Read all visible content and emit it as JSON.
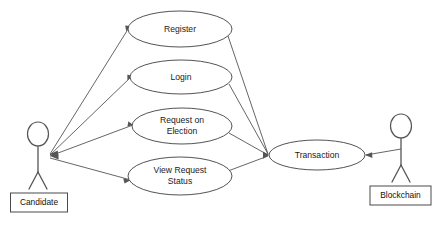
{
  "diagram": {
    "type": "uml-use-case",
    "background_color": "#ffffff",
    "line_color": "#555555",
    "shape_stroke_color": "#3f3f3f",
    "text_color": "#1a1a1a"
  },
  "actors": [
    {
      "id": "candidate",
      "label": "Candidate",
      "side": "left",
      "head_center": [
        38,
        134
      ],
      "body_point": [
        48,
        155
      ]
    },
    {
      "id": "blockchain",
      "label": "Blockchain",
      "side": "right",
      "head_center": [
        401,
        126
      ],
      "body_point": [
        401,
        150
      ]
    }
  ],
  "use_cases": [
    {
      "id": "register",
      "label": "Register",
      "lines": [
        "Register"
      ],
      "cx": 180,
      "cy": 29,
      "rx": 52,
      "ry": 18
    },
    {
      "id": "login",
      "label": "Login",
      "lines": [
        "Login"
      ],
      "cx": 181,
      "cy": 77,
      "rx": 51,
      "ry": 17
    },
    {
      "id": "request-on-election",
      "label": "Request on Election",
      "lines": [
        "Request on",
        "Election"
      ],
      "cx": 182,
      "cy": 126,
      "rx": 50,
      "ry": 18
    },
    {
      "id": "view-request-status",
      "label": "View Request Status",
      "lines": [
        "View Request",
        "Status"
      ],
      "cx": 180,
      "cy": 176,
      "rx": 52,
      "ry": 19
    },
    {
      "id": "transaction",
      "label": "Transaction",
      "lines": [
        "Transaction"
      ],
      "cx": 317,
      "cy": 155,
      "rx": 48,
      "ry": 15
    }
  ],
  "associations": [
    {
      "id": "candidate-register",
      "from": "candidate",
      "to": "register",
      "arrow_at": "candidate"
    },
    {
      "id": "candidate-login",
      "from": "candidate",
      "to": "login",
      "arrow_at": "candidate"
    },
    {
      "id": "candidate-request-on-election",
      "from": "candidate",
      "to": "request-on-election",
      "arrow_at": "candidate"
    },
    {
      "id": "candidate-view-request-status",
      "from": "candidate",
      "to": "view-request-status",
      "arrow_at": "view-request-status"
    },
    {
      "id": "register-transaction",
      "from": "register",
      "to": "transaction",
      "arrow_at": "transaction"
    },
    {
      "id": "login-transaction",
      "from": "login",
      "to": "transaction",
      "arrow_at": "transaction"
    },
    {
      "id": "request-on-election-transaction",
      "from": "request-on-election",
      "to": "transaction",
      "arrow_at": "transaction"
    },
    {
      "id": "view-request-status-transaction",
      "from": "view-request-status",
      "to": "transaction",
      "arrow_at": "transaction"
    },
    {
      "id": "blockchain-transaction",
      "from": "blockchain",
      "to": "transaction",
      "arrow_at": "transaction"
    }
  ]
}
